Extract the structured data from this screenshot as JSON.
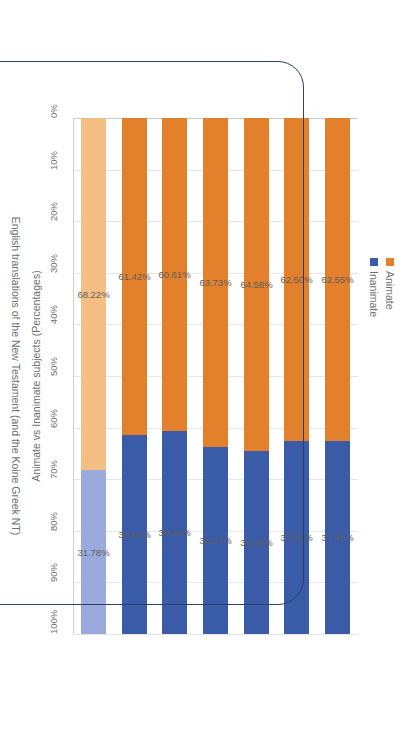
{
  "chart_data": {
    "type": "bar",
    "subtype": "100% stacked horizontal bar",
    "title": "",
    "xlabel": "English translations of the New Testament (and the Koine Greek NT)",
    "ylabel": "Animate vs Inanimate subjects (Percentages)",
    "ylim": [
      0,
      100
    ],
    "grid": true,
    "legend_position": "top-right",
    "categories": [
      "1. English translations of the New Testament (total)",
      "2. Wycliffe 1380, 1388 <M3>",
      "3. Tyndale 1526 – 1534  <E1>",
      "4. Authorised Version 1611  <E2>",
      "5. English Revised Version 1881 <B3>",
      "6. English Standard Version 2001",
      "7. Koine Greek NT)"
    ],
    "tick_labels": [
      "0%",
      "10%",
      "20%",
      "30%",
      "40%",
      "50%",
      "60%",
      "70%",
      "80%",
      "90%",
      "100%"
    ],
    "series": [
      {
        "name": "Animate",
        "values": [
          62.55,
          62.5,
          64.58,
          63.73,
          60.61,
          61.42,
          68.22
        ]
      },
      {
        "name": "Inanimate",
        "values": [
          37.45,
          37.5,
          35.42,
          36.27,
          39.39,
          38.58,
          31.78
        ]
      }
    ],
    "value_labels": {
      "animate": [
        "62.55%",
        "62.50%",
        "64.58%",
        "63.73%",
        "60.61%",
        "61.42%",
        "68.22%"
      ],
      "inanimate": [
        "37.45%",
        "37.50%",
        "35.42%",
        "36.27%",
        "39.39%",
        "38.58%",
        "31.78%"
      ]
    }
  },
  "legend": {
    "items": [
      {
        "label": "Animate",
        "color": "#E2802C"
      },
      {
        "label": "Inanimate",
        "color": "#3A5BA8"
      }
    ]
  },
  "colors": {
    "animate": "#E2802C",
    "inanimate": "#3A5BA8",
    "animate_light": "#F5BE82",
    "inanimate_light": "#9BAADC",
    "annotation": "#2E3F6E",
    "gridline": "#E6E6E6",
    "text": "#6F6F6F"
  },
  "annotation": {
    "name": "rounded-rectangle-highlight",
    "covers": "categories 2 through 6"
  }
}
